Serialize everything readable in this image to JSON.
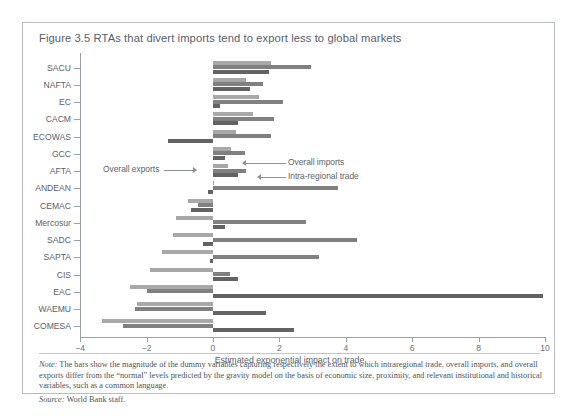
{
  "figure": {
    "title": "Figure 3.5  RTAs that divert imports tend to export less to global markets",
    "note_label": "Note:",
    "note_text": " The bars show the magnitude of the dummy variables capturing respectively the extent to which intraregional trade, overall imports, and overall exports differ from the “normal” levels predicted by the gravity model on the basis of economic size, proximity, and relevant institutional and historical variables, such as a common language.",
    "source_label": "Source:",
    "source_text": " World Bank staff."
  },
  "annotations": {
    "overall_exports": "Overall exports",
    "overall_imports": "Overall imports",
    "intra_regional": "Intra-regional trade"
  },
  "colors": {
    "intra_regional_trade": "#a8a8a8",
    "overall_imports": "#808080",
    "overall_exports": "#636363",
    "axis": "#9aa0a6",
    "text": "#5b6168",
    "border": "#b9bcc0"
  },
  "chart_data": {
    "type": "bar",
    "orientation": "horizontal",
    "title": "Figure 3.5  RTAs that divert imports tend to export less to global markets",
    "xlabel": "Estimated exponential impact on trade",
    "ylabel": "",
    "xlim": [
      -4,
      10
    ],
    "xticks": [
      -4,
      -2,
      0,
      2,
      4,
      6,
      8,
      10
    ],
    "xticklabels": [
      "−4",
      "−2",
      "0",
      "2",
      "4",
      "6",
      "8",
      "10"
    ],
    "grid": false,
    "legend": "inline-annotations",
    "categories": [
      "SACU",
      "NAFTA",
      "EC",
      "CACM",
      "ECOWAS",
      "GCC",
      "AFTA",
      "ANDEAN",
      "CEMAC",
      "Mercosur",
      "SADC",
      "SAPTA",
      "CIS",
      "EAC",
      "WAEMU",
      "COMESA"
    ],
    "series": [
      {
        "name": "Intra-regional trade",
        "color": "#a8a8a8",
        "values": [
          1.75,
          1.0,
          1.4,
          1.2,
          0.7,
          0.55,
          0.45,
          0.0,
          -0.75,
          -1.1,
          -1.2,
          -1.55,
          -1.9,
          -2.5,
          -2.3,
          -3.35
        ]
      },
      {
        "name": "Overall imports",
        "color": "#808080",
        "values": [
          2.95,
          1.5,
          2.1,
          1.85,
          1.75,
          0.95,
          1.0,
          3.75,
          -0.45,
          2.8,
          4.35,
          3.2,
          0.5,
          -2.0,
          -2.35,
          -2.7
        ]
      },
      {
        "name": "Overall exports",
        "color": "#636363",
        "values": [
          1.7,
          1.1,
          0.2,
          0.75,
          -1.35,
          0.35,
          0.75,
          -0.15,
          -0.65,
          0.35,
          -0.3,
          -0.1,
          0.75,
          9.95,
          1.6,
          2.45
        ]
      }
    ]
  }
}
